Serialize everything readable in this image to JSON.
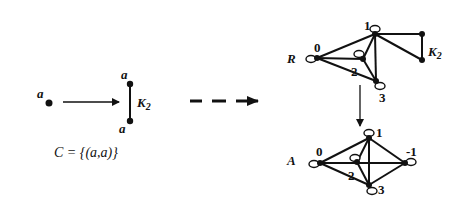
{
  "left": {
    "source_vertex_label": "a",
    "target_top_label": "a",
    "target_bottom_label": "a",
    "target_graph_label": "K",
    "target_graph_subscript": "2",
    "constraint": "C = {(a,a)}"
  },
  "r_graph": {
    "name": "R",
    "vertices": [
      "0",
      "1",
      "2",
      "3"
    ],
    "attached_label": "K",
    "attached_subscript": "2"
  },
  "a_graph": {
    "name": "A",
    "vertices": [
      "0",
      "1",
      "2",
      "3",
      "-1"
    ]
  },
  "arrows": {
    "map_arrow": "solid",
    "transform_arrow": "dashed",
    "down_arrow": "solid"
  }
}
